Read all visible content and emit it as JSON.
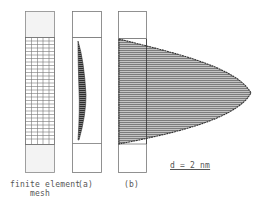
{
  "figure": {
    "panels": [
      {
        "id": "mesh",
        "label_line1": "finite element",
        "label_line2": "mesh"
      },
      {
        "id": "a",
        "label": "(a)"
      },
      {
        "id": "b",
        "label": "(b)"
      }
    ],
    "scale_label": "d = 2 nm",
    "colors": {
      "frame": "#777777",
      "grid": "#666666",
      "fill": "#bbbbbb",
      "hatch": "#555555",
      "outline": "#333333",
      "label": "#555555"
    }
  }
}
